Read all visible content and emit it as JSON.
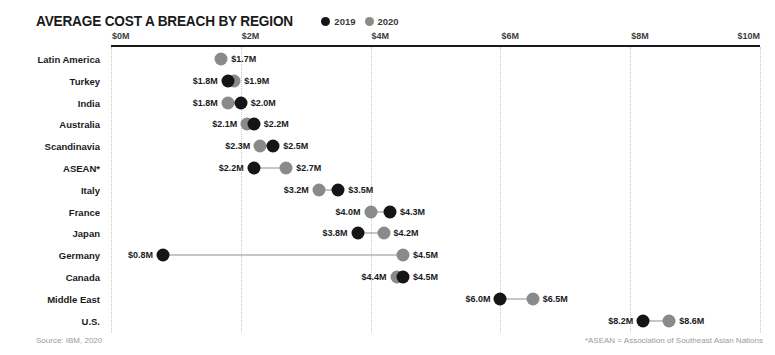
{
  "header": {
    "title": "AVERAGE COST A BREACH BY REGION",
    "legend": [
      {
        "label": "2019",
        "color": "#151515",
        "swatch_icon": "filled-circle-icon"
      },
      {
        "label": "2020",
        "color": "#8a8a8a",
        "swatch_icon": "filled-circle-icon"
      }
    ]
  },
  "footer": {
    "source": "Source: IBM, 2020",
    "asean_note": "*ASEAN = Association of Southeast Asian Nations"
  },
  "colors": {
    "series_2019": "#151515",
    "series_2020": "#8a8a8a",
    "axis": "#1a1a1a",
    "gridline": "#c9c9c9",
    "connector": "#8d8d8d",
    "footer_text": "#9a9a9a"
  },
  "chart_data": {
    "type": "scatter",
    "subtype": "dumbbell",
    "title": "AVERAGE COST A BREACH BY REGION",
    "subtitle": "",
    "xlabel": "",
    "ylabel": "",
    "xlim": [
      0,
      10
    ],
    "xticks": [
      0,
      2,
      4,
      6,
      8,
      10
    ],
    "xtick_labels": [
      "$0M",
      "$2M",
      "$4M",
      "$6M",
      "$8M",
      "$10M"
    ],
    "grid": true,
    "grid_axis": "x",
    "legend_position": "top-right-of-title",
    "units": "millions of USD",
    "series": [
      {
        "name": "2019",
        "color": "#151515",
        "values": [
          null,
          1.8,
          2.0,
          2.2,
          2.5,
          2.2,
          3.5,
          4.3,
          3.8,
          0.8,
          4.5,
          6.0,
          8.2
        ]
      },
      {
        "name": "2020",
        "color": "#8a8a8a",
        "values": [
          1.7,
          1.9,
          1.8,
          2.1,
          2.3,
          2.7,
          3.2,
          4.0,
          4.2,
          4.5,
          4.4,
          6.5,
          8.6
        ]
      }
    ],
    "categories": [
      "Latin America",
      "Turkey",
      "India",
      "Australia",
      "Scandinavia",
      "ASEAN*",
      "Italy",
      "France",
      "Japan",
      "Germany",
      "Canada",
      "Middle East",
      "U.S."
    ],
    "rows": [
      {
        "category": "Latin America",
        "points": [
          {
            "series": "2020",
            "value": 1.7,
            "label": "$1.7M",
            "label_side": "right"
          }
        ]
      },
      {
        "category": "Turkey",
        "points": [
          {
            "series": "2019",
            "value": 1.8,
            "label": "$1.8M",
            "label_side": "left"
          },
          {
            "series": "2020",
            "value": 1.9,
            "label": "$1.9M",
            "label_side": "right"
          }
        ]
      },
      {
        "category": "India",
        "points": [
          {
            "series": "2020",
            "value": 1.8,
            "label": "$1.8M",
            "label_side": "left"
          },
          {
            "series": "2019",
            "value": 2.0,
            "label": "$2.0M",
            "label_side": "right"
          }
        ]
      },
      {
        "category": "Australia",
        "points": [
          {
            "series": "2020",
            "value": 2.1,
            "label": "$2.1M",
            "label_side": "left"
          },
          {
            "series": "2019",
            "value": 2.2,
            "label": "$2.2M",
            "label_side": "right"
          }
        ]
      },
      {
        "category": "Scandinavia",
        "points": [
          {
            "series": "2020",
            "value": 2.3,
            "label": "$2.3M",
            "label_side": "left"
          },
          {
            "series": "2019",
            "value": 2.5,
            "label": "$2.5M",
            "label_side": "right"
          }
        ]
      },
      {
        "category": "ASEAN*",
        "points": [
          {
            "series": "2019",
            "value": 2.2,
            "label": "$2.2M",
            "label_side": "left"
          },
          {
            "series": "2020",
            "value": 2.7,
            "label": "$2.7M",
            "label_side": "right"
          }
        ]
      },
      {
        "category": "Italy",
        "points": [
          {
            "series": "2020",
            "value": 3.2,
            "label": "$3.2M",
            "label_side": "left"
          },
          {
            "series": "2019",
            "value": 3.5,
            "label": "$3.5M",
            "label_side": "right"
          }
        ]
      },
      {
        "category": "France",
        "points": [
          {
            "series": "2020",
            "value": 4.0,
            "label": "$4.0M",
            "label_side": "left"
          },
          {
            "series": "2019",
            "value": 4.3,
            "label": "$4.3M",
            "label_side": "right"
          }
        ]
      },
      {
        "category": "Japan",
        "points": [
          {
            "series": "2019",
            "value": 3.8,
            "label": "$3.8M",
            "label_side": "left"
          },
          {
            "series": "2020",
            "value": 4.2,
            "label": "$4.2M",
            "label_side": "right"
          }
        ]
      },
      {
        "category": "Germany",
        "points": [
          {
            "series": "2019",
            "value": 0.8,
            "label": "$0.8M",
            "label_side": "left"
          },
          {
            "series": "2020",
            "value": 4.5,
            "label": "$4.5M",
            "label_side": "right"
          }
        ]
      },
      {
        "category": "Canada",
        "points": [
          {
            "series": "2020",
            "value": 4.4,
            "label": "$4.4M",
            "label_side": "left"
          },
          {
            "series": "2019",
            "value": 4.5,
            "label": "$4.5M",
            "label_side": "right"
          }
        ]
      },
      {
        "category": "Middle East",
        "points": [
          {
            "series": "2019",
            "value": 6.0,
            "label": "$6.0M",
            "label_side": "left"
          },
          {
            "series": "2020",
            "value": 6.5,
            "label": "$6.5M",
            "label_side": "right"
          }
        ]
      },
      {
        "category": "U.S.",
        "points": [
          {
            "series": "2019",
            "value": 8.2,
            "label": "$8.2M",
            "label_side": "left"
          },
          {
            "series": "2020",
            "value": 8.6,
            "label": "$8.6M",
            "label_side": "right"
          }
        ]
      }
    ]
  }
}
